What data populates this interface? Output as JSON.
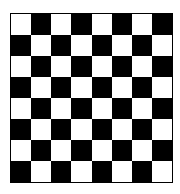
{
  "board": {
    "rows": 8,
    "cols": 8,
    "top_left_color": "light",
    "colors": {
      "light": "#ffffff",
      "dark": "#000000",
      "border": "#000000"
    }
  }
}
